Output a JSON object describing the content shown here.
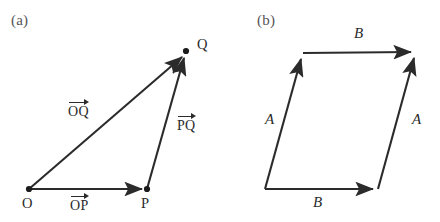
{
  "figure": {
    "width": 440,
    "height": 222,
    "background": "#ffffff",
    "stroke_color": "#2b2b2b",
    "tag_color": "#555555"
  },
  "panel_a": {
    "tag": "(a)",
    "points": [
      {
        "name": "O",
        "label": "O",
        "x": 29,
        "y": 189
      },
      {
        "name": "P",
        "label": "P",
        "x": 147,
        "y": 189
      },
      {
        "name": "Q",
        "label": "Q",
        "x": 186,
        "y": 51
      }
    ],
    "vectors": [
      {
        "name": "OP",
        "label": "OP",
        "from": "O",
        "to": "P"
      },
      {
        "name": "OQ",
        "label": "OQ",
        "from": "O",
        "to": "Q"
      },
      {
        "name": "PQ",
        "label": "PQ",
        "from": "P",
        "to": "Q"
      }
    ]
  },
  "panel_b": {
    "tag": "(b)",
    "vertices": [
      {
        "name": "bottom-left",
        "x": 265,
        "y": 189
      },
      {
        "name": "bottom-right",
        "x": 378,
        "y": 189
      },
      {
        "name": "top-left",
        "x": 303,
        "y": 53
      },
      {
        "name": "top-right",
        "x": 416,
        "y": 52
      }
    ],
    "vectors": [
      {
        "name": "A-left",
        "label": "A",
        "from": "bottom-left",
        "to": "top-left"
      },
      {
        "name": "A-right",
        "label": "A",
        "from": "bottom-right",
        "to": "top-right"
      },
      {
        "name": "B-top",
        "label": "B",
        "from": "top-left",
        "to": "top-right"
      },
      {
        "name": "B-bottom",
        "label": "B",
        "from": "bottom-left",
        "to": "bottom-right"
      }
    ]
  }
}
